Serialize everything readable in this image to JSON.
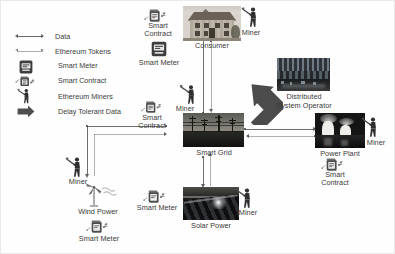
{
  "legend": {
    "items": [
      {
        "label": "Data",
        "icon": "arrow-thick-double-icon"
      },
      {
        "label": "Ethereum Tokens",
        "icon": "arrow-thin-double-icon"
      },
      {
        "label": "Smart Meter",
        "icon": "smart-meter-icon"
      },
      {
        "label": "Smart Contract",
        "icon": "smart-contract-icon"
      },
      {
        "label": "Ethereum Miners",
        "icon": "miner-icon"
      },
      {
        "label": "Delay Tolerant Data",
        "icon": "block-arrow-icon"
      }
    ]
  },
  "nodes": {
    "consumer": {
      "label": "Consumer",
      "image": "house-photo"
    },
    "smart_grid": {
      "label": "Smart Grid",
      "image": "powerline-photo"
    },
    "dso": {
      "label": "Distributed\nSystem Operator",
      "label_line1": "Distributed",
      "label_line2": "System Operator",
      "image": "operator-building-photo"
    },
    "power_plant": {
      "label": "Power Plant",
      "image": "cooling-towers-photo"
    },
    "solar": {
      "label": "Solar Power",
      "image": "solar-panels-photo"
    },
    "wind": {
      "label": "Wind Power",
      "image": "wind-turbine-icon"
    }
  },
  "annotations": {
    "smart_contract": "Smart\nContract",
    "smart_contract_line1": "Smart",
    "smart_contract_line2": "Contract",
    "smart_meter": "Smart Meter",
    "miner": "Miner"
  },
  "attached": {
    "consumer": {
      "smart_contract": "Smart Contract",
      "smart_meter": "Smart Meter",
      "miner": "Miner"
    },
    "smart_grid": {
      "smart_contract": "Smart Contract",
      "miner": "Miner"
    },
    "power_plant": {
      "smart_contract": "Smart Contract",
      "miner": "Miner"
    },
    "solar": {
      "smart_meter": "Smart Meter",
      "miner": "Miner"
    },
    "wind": {
      "smart_meter": "Smart Meter",
      "miner": "Miner"
    }
  },
  "edges": [
    {
      "from": "smart_grid",
      "to": "consumer",
      "types": [
        "Data",
        "Ethereum Tokens"
      ]
    },
    {
      "from": "smart_grid",
      "to": "dso",
      "types": [
        "Delay Tolerant Data"
      ]
    },
    {
      "from": "smart_grid",
      "to": "power_plant",
      "types": [
        "Data",
        "Ethereum Tokens"
      ]
    },
    {
      "from": "smart_grid",
      "to": "solar",
      "types": [
        "Data",
        "Ethereum Tokens"
      ]
    },
    {
      "from": "smart_grid",
      "to": "wind",
      "types": [
        "Data",
        "Ethereum Tokens"
      ]
    }
  ],
  "colors": {
    "line": "#6e6e6e",
    "text": "#3a3a3a",
    "block_arrow": "#4a4a4a",
    "background": "#ffffff"
  }
}
